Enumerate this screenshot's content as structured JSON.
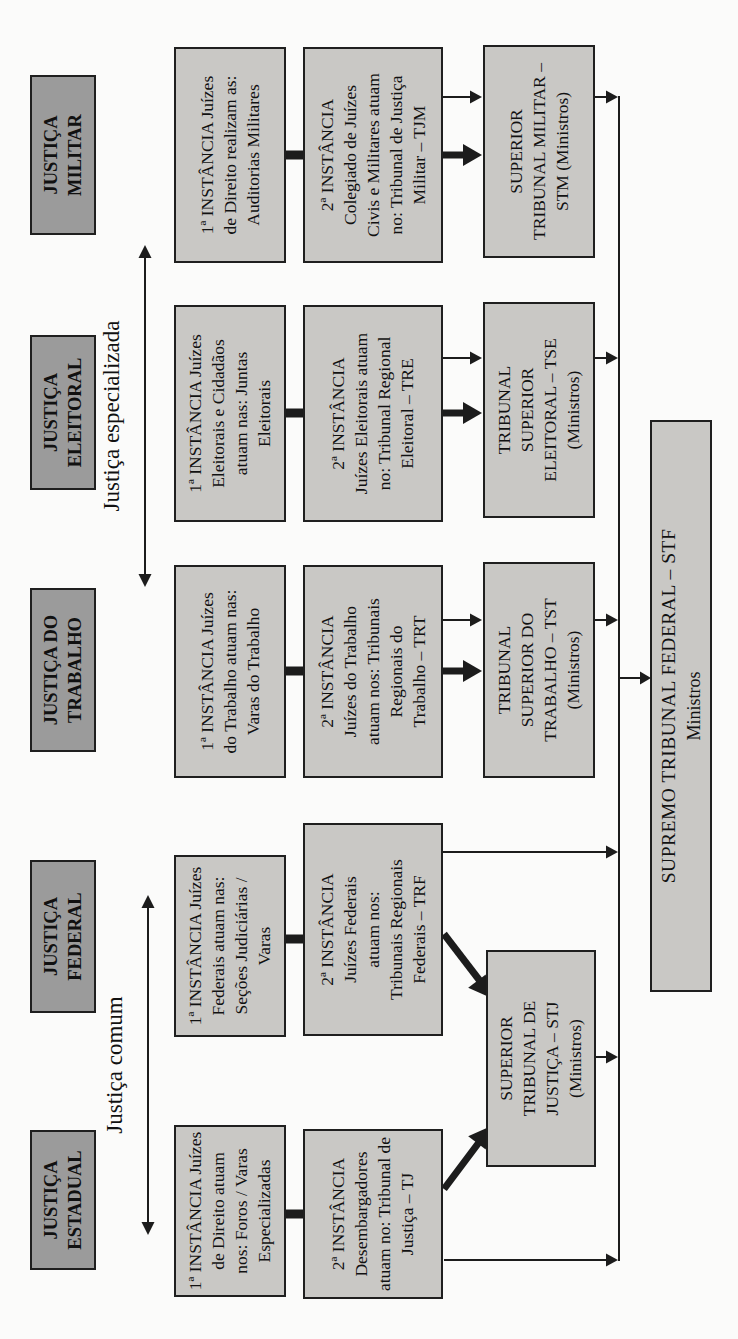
{
  "diagram": {
    "groups": [
      {
        "label": "Justiça comum"
      },
      {
        "label": "Justiça especializada"
      }
    ],
    "columns": [
      {
        "id": "estadual",
        "header": [
          "JUSTIÇA",
          "ESTADUAL"
        ],
        "instancia1": [
          "1ª INSTÂNCIA Juízes",
          "de Direito atuam",
          "nos: Foros / Varas",
          "Especializadas"
        ],
        "instancia2": [
          "2ª INSTÂNCIA",
          "Desembargadores",
          "atuam no: Tribunal de",
          "Justiça – TJ"
        ]
      },
      {
        "id": "federal",
        "header": [
          "JUSTIÇA",
          "FEDERAL"
        ],
        "instancia1": [
          "1ª INSTÂNCIA Juízes",
          "Federais atuam nas:",
          "Seções Judiciárias /",
          "Varas"
        ],
        "instancia2": [
          "2ª INSTÂNCIA",
          "Juízes Federais",
          "atuam nos:",
          "Tribunais Regionais",
          "Federais – TRF"
        ]
      },
      {
        "id": "trabalho",
        "header": [
          "JUSTIÇA DO",
          "TRABALHO"
        ],
        "instancia1": [
          "1ª INSTÂNCIA Juízes",
          "do Trabalho atuam nas:",
          "Varas do Trabalho"
        ],
        "instancia2": [
          "2ª INSTÂNCIA",
          "Juízes do Trabalho",
          "atuam nos: Tribunais",
          "Regionais do",
          "Trabalho – TRT"
        ],
        "tribunal": [
          "TRIBUNAL",
          "SUPERIOR DO",
          "TRABALHO – TST",
          "(Ministros)"
        ]
      },
      {
        "id": "eleitoral",
        "header": [
          "JUSTIÇA",
          "ELEITORAL"
        ],
        "instancia1": [
          "1ª INSTÂNCIA Juízes",
          "Eleitorais e Cidadãos",
          "atuam nas: Juntas",
          "Eleitorais"
        ],
        "instancia2": [
          "2ª INSTÂNCIA",
          "Juízes Eleitorais atuam",
          "no: Tribunal Regional",
          "Eleitoral – TRE"
        ],
        "tribunal": [
          "TRIBUNAL",
          "SUPERIOR",
          "ELEITORAL – TSE",
          "(Ministros)"
        ]
      },
      {
        "id": "militar",
        "header": [
          "JUSTIÇA",
          "MILITAR"
        ],
        "instancia1": [
          "1ª INSTÂNCIA Juízes",
          "de Direito realizam as:",
          "Auditorias Militares"
        ],
        "instancia2": [
          "2ª INSTÂNCIA",
          "Colegiado de Juízes",
          "Civis e Militares atuam",
          "no: Tribunal de Justiça",
          "Militar – TJM"
        ],
        "tribunal": [
          "SUPERIOR",
          "TRIBUNAL MILITAR –",
          "STM (Ministros)"
        ]
      }
    ],
    "stj": [
      "SUPERIOR",
      "TRIBUNAL DE",
      "JUSTIÇA – STJ",
      "(Ministros)"
    ],
    "stf": {
      "title": "SUPREMO TRIBUNAL FEDERAL – STF",
      "subtitle": "Ministros"
    },
    "colors": {
      "header_fill": "#9b9b9b",
      "box_fill": "#c9c8c5",
      "border": "#1f1f1f",
      "line": "#1c1c1c",
      "text": "#111111",
      "background": "#fbfbfa"
    }
  }
}
